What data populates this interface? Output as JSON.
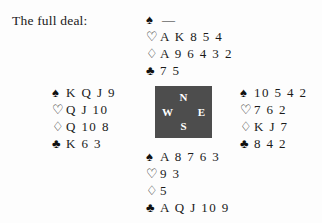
{
  "caption": "The full deal:",
  "suit_glyphs": {
    "spade": "♠",
    "heart": "♡",
    "diamond": "♢",
    "club": "♣"
  },
  "void_marker": "—",
  "compass": {
    "north": "N",
    "east": "E",
    "south": "S",
    "west": "W",
    "box_color": "#4d4d4d",
    "label_color": "#ffffff"
  },
  "hands": {
    "north": {
      "seat": "North",
      "spades": "—",
      "hearts": "A K 8 5 4",
      "diamonds": "A 9 6 4 3 2",
      "clubs": "7 5"
    },
    "west": {
      "seat": "West",
      "spades": "K Q J 9",
      "hearts": "Q J 10",
      "diamonds": "Q 10 8",
      "clubs": "K 6 3"
    },
    "east": {
      "seat": "East",
      "spades": "10 5 4 2",
      "hearts": "7 6 2",
      "diamonds": "K J 7",
      "clubs": "8 4 2"
    },
    "south": {
      "seat": "South",
      "spades": "A 8 7 6 3",
      "hearts": "9 3",
      "diamonds": "5",
      "clubs": "A Q J 10 9"
    }
  }
}
